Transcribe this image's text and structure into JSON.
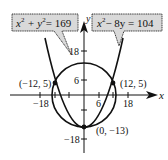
{
  "diagram": {
    "equations": [
      {
        "text": "x² + y² = 169",
        "base1": "x",
        "sup1": "2",
        "mid": " + y",
        "sup2": "2",
        "tail": "= 169"
      },
      {
        "text": "x² − 8y = 104",
        "base1": "x",
        "sup1": "2",
        "tail": "− 8y = 104"
      }
    ],
    "axes": {
      "x_label": "x",
      "y_label": "y",
      "x_ticks": [
        "−18",
        "6",
        "18"
      ],
      "y_ticks": [
        "18",
        "6",
        "−18"
      ]
    },
    "points": [
      {
        "label": "(−12, 5)",
        "x": -12,
        "y": 5
      },
      {
        "label": "(12, 5)",
        "x": 12,
        "y": 5
      },
      {
        "label": "(0, −13)",
        "x": 0,
        "y": -13
      }
    ],
    "curves": [
      {
        "name": "circle",
        "equation": "x^2 + y^2 = 169",
        "radius": 13
      },
      {
        "name": "parabola",
        "equation": "x^2 - 8y = 104"
      }
    ],
    "colors": {
      "stroke": "#111111",
      "label_fill": "#d9d9d9"
    }
  }
}
